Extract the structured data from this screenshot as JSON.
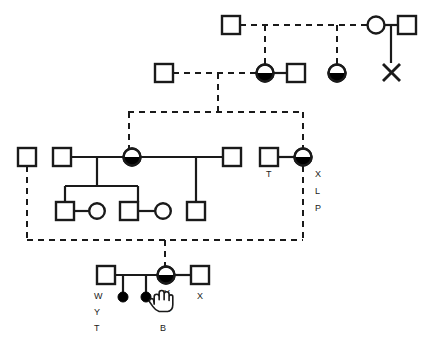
{
  "diagram": {
    "type": "family-pedigree",
    "width": 431,
    "height": 354,
    "background_color": "#ffffff",
    "stroke_color": "#1a1a1a",
    "fill_color": "#000000",
    "legend_note": ""
  },
  "labels": {
    "partner_T": "T",
    "carrier_X": "X",
    "carrier_L": "L",
    "carrier_P": "P",
    "son_W": "W",
    "son_Y": "Y",
    "son_T": "T",
    "cursor_Y": "Y",
    "cursor_A": "A",
    "child_B": "B",
    "partner_X": "X"
  },
  "symbols": {
    "square": "unaffected-male",
    "circle": "unaffected-female",
    "half_filled_circle": "affected-carrier-female",
    "filled_dot": "affected-individual",
    "cross": "deceased-or-terminated-pregnancy",
    "solid_line": "biological-relationship",
    "dashed_line": "inferred-relationship"
  },
  "generations": [
    {
      "id": "generation-1",
      "y": 25,
      "members": [
        {
          "name": "g1-male-1",
          "shape": "square",
          "x": 231,
          "filled": false
        },
        {
          "name": "g1-female-1",
          "shape": "circle",
          "x": 376,
          "filled": false
        },
        {
          "name": "g1-male-2",
          "shape": "square",
          "x": 407,
          "filled": false
        },
        {
          "name": "g1-terminated-pregnancy",
          "shape": "cross",
          "x": 391,
          "y": 72
        }
      ]
    },
    {
      "id": "generation-2",
      "y": 73,
      "members": [
        {
          "name": "g2-male-1",
          "shape": "square",
          "x": 164,
          "filled": false
        },
        {
          "name": "g2-female-carrier-1",
          "shape": "circle",
          "x": 265,
          "filled": "half"
        },
        {
          "name": "g2-male-2",
          "shape": "square",
          "x": 296,
          "filled": false
        },
        {
          "name": "g2-female-carrier-2",
          "shape": "circle",
          "x": 337,
          "filled": "half"
        }
      ]
    },
    {
      "id": "generation-3",
      "y": 157,
      "members": [
        {
          "name": "g3-male-outer-left",
          "shape": "square",
          "x": 27,
          "filled": false
        },
        {
          "name": "g3-male-1",
          "shape": "square",
          "x": 62,
          "filled": false
        },
        {
          "name": "g3-female-carrier-proband",
          "shape": "circle",
          "x": 132,
          "filled": "half"
        },
        {
          "name": "g3-male-2",
          "shape": "square",
          "x": 232,
          "filled": false
        },
        {
          "name": "g3-male-T",
          "shape": "square",
          "x": 269,
          "filled": false
        },
        {
          "name": "g3-female-carrier-right",
          "shape": "circle",
          "x": 303,
          "filled": "half"
        }
      ]
    },
    {
      "id": "generation-4",
      "y": 211,
      "members": [
        {
          "name": "g4-male-1",
          "shape": "square",
          "x": 65,
          "filled": false
        },
        {
          "name": "g4-female-1",
          "shape": "circle",
          "x": 97,
          "filled": false
        },
        {
          "name": "g4-male-2",
          "shape": "square",
          "x": 129,
          "filled": false
        },
        {
          "name": "g4-female-2",
          "shape": "circle",
          "x": 163,
          "filled": false
        },
        {
          "name": "g4-male-3",
          "shape": "square",
          "x": 196,
          "filled": false
        }
      ]
    },
    {
      "id": "generation-5",
      "y": 275,
      "members": [
        {
          "name": "g5-male-W",
          "shape": "square",
          "x": 106,
          "filled": false
        },
        {
          "name": "g5-female-carrier",
          "shape": "circle",
          "x": 166,
          "filled": "half"
        },
        {
          "name": "g5-male-X",
          "shape": "square",
          "x": 200,
          "filled": false
        },
        {
          "name": "g5-affected-child-1",
          "shape": "dot",
          "x": 123,
          "y": 296
        },
        {
          "name": "g5-affected-child-2",
          "shape": "dot",
          "x": 146,
          "y": 296
        }
      ]
    }
  ]
}
